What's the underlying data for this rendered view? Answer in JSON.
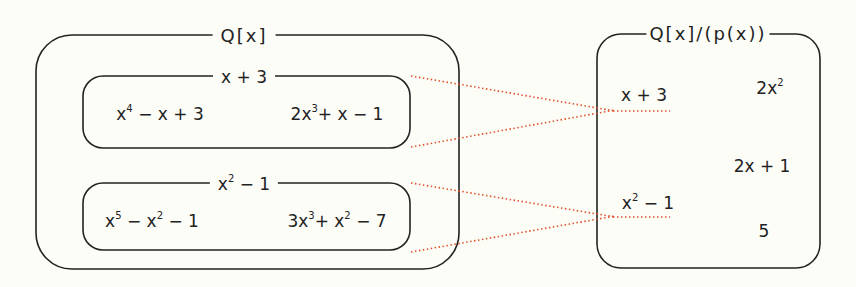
{
  "left_box": {
    "title": "Q[x]",
    "classes": [
      {
        "label_base": "x + 3",
        "members": [
          {
            "parts": [
              "x",
              "4",
              " − x + 3"
            ]
          },
          {
            "parts": [
              "2x",
              "3",
              "+ x − 1"
            ]
          }
        ]
      },
      {
        "label_parts": [
          "x",
          "2",
          " − 1"
        ],
        "members": [
          {
            "parts": [
              "x",
              "5",
              " − x",
              "2",
              " − 1"
            ]
          },
          {
            "parts": [
              "3x",
              "3",
              "+ x",
              "2",
              " − 7"
            ]
          }
        ]
      }
    ]
  },
  "right_box": {
    "title": "Q[x]/(p(x))",
    "elements": [
      {
        "parts": [
          "x + 3"
        ]
      },
      {
        "parts": [
          "2x",
          "2"
        ]
      },
      {
        "parts": [
          "2x + 1"
        ]
      },
      {
        "parts": [
          "x",
          "2",
          " − 1"
        ]
      },
      {
        "parts": [
          "5"
        ]
      }
    ]
  },
  "colors": {
    "stroke": "#222222",
    "mapping_line": "#e0502a",
    "background": "#fdfdf8"
  },
  "mappings": [
    {
      "from": "x + 3 class",
      "to": "x + 3"
    },
    {
      "from": "x^2 − 1 class",
      "to": "x^2 − 1"
    }
  ]
}
